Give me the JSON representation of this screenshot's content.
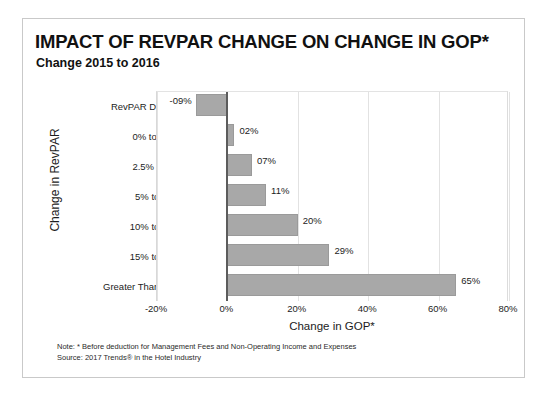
{
  "chart_data": {
    "type": "bar",
    "orientation": "horizontal",
    "title": "IMPACT OF REVPAR CHANGE ON CHANGE IN GOP*",
    "subtitle": "Change 2015 to 2016",
    "xlabel": "Change in GOP*",
    "ylabel": "Change in RevPAR",
    "categories": [
      "RevPAR Decline",
      "0% to 2.5%",
      "2.5% to 5%",
      "5% to 10%",
      "10% to 15%",
      "15% to 20%",
      "Greater Than 20%"
    ],
    "values": [
      -9,
      2,
      7,
      11,
      20,
      29,
      65
    ],
    "data_labels": [
      "-09%",
      "02%",
      "07%",
      "11%",
      "20%",
      "29%",
      "65%"
    ],
    "xlim": [
      -20,
      80
    ],
    "xticks": [
      -20,
      0,
      20,
      40,
      60,
      80
    ],
    "xtick_labels": [
      "-20%",
      "0%",
      "20%",
      "40%",
      "60%",
      "80%"
    ],
    "grid": true,
    "grid_axis": "x",
    "legend": false,
    "bar_color": "#a8a8a8",
    "bar_edge_color": "#9a9a9a",
    "gridline_color": "#e2e2e2",
    "zero_line_color": "#5c5c5c"
  },
  "footnotes": {
    "note": "Note:  * Before deduction for Management Fees and Non-Operating Income and Expenses",
    "source": "Source:  2017 Trends® in the Hotel Industry"
  }
}
